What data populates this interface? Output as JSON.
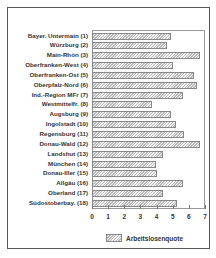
{
  "chart_data": {
    "type": "bar",
    "orientation": "horizontal",
    "title": "",
    "xlabel": "",
    "ylabel": "",
    "xlim": [
      0,
      7
    ],
    "xticks": [
      "0",
      "1",
      "2",
      "3",
      "4",
      "5",
      "6",
      "7"
    ],
    "grid": false,
    "legend_position": "bottom",
    "categories": [
      "Bayer. Untermain (1)",
      "Würzburg (2)",
      "Main-Rhön (3)",
      "Oberfranken-West (4)",
      "Oberfranken-Ost (5)",
      "Oberpfalz-Nord (6)",
      "Ind.-Region MFr (7)",
      "Westmittelfr. (8)",
      "Augsburg (9)",
      "Ingolstadt (10)",
      "Regensburg (11)",
      "Donau-Wald (12)",
      "Landshut (13)",
      "München (14)",
      "Donau-Iller (15)",
      "Allgäu (16)",
      "Oberland (17)",
      "Südostoberbay. (18)"
    ],
    "series": [
      {
        "name": "Arbeitslosenquote",
        "values": [
          4.9,
          4.65,
          6.7,
          5.0,
          6.3,
          6.5,
          5.65,
          3.7,
          4.9,
          5.2,
          5.7,
          6.7,
          4.4,
          3.95,
          4.0,
          5.65,
          4.4,
          5.25
        ]
      }
    ]
  },
  "legend": {
    "label": "Arbeitslosenquote"
  }
}
